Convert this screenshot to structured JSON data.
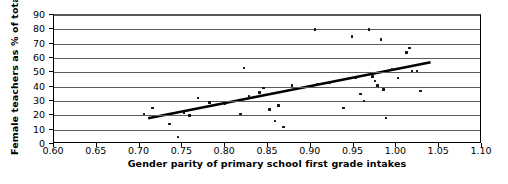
{
  "chart_data": {
    "type": "scatter",
    "title": "",
    "xlabel": "Gender parity of primary school first grade intakes",
    "ylabel": "Female teachers as % of total",
    "xlim": [
      0.6,
      1.1
    ],
    "ylim": [
      0,
      90
    ],
    "grid": true,
    "legend": "none",
    "xticks": [
      "0.60",
      "0.65",
      "0.70",
      "0.75",
      "0.80",
      "0.85",
      "0.90",
      "0.95",
      "1.00",
      "1.05",
      "1.10"
    ],
    "xtick_values": [
      0.6,
      0.65,
      0.7,
      0.75,
      0.8,
      0.85,
      0.9,
      0.95,
      1.0,
      1.05,
      1.1
    ],
    "yticks": [
      "0",
      "10",
      "20",
      "30",
      "40",
      "50",
      "60",
      "70",
      "80",
      "90"
    ],
    "ytick_values": [
      0,
      10,
      20,
      30,
      40,
      50,
      60,
      70,
      80,
      90
    ],
    "points": [
      {
        "x": 0.705,
        "y": 21
      },
      {
        "x": 0.715,
        "y": 25
      },
      {
        "x": 0.735,
        "y": 14
      },
      {
        "x": 0.745,
        "y": 5
      },
      {
        "x": 0.752,
        "y": 22
      },
      {
        "x": 0.758,
        "y": 20
      },
      {
        "x": 0.768,
        "y": 32
      },
      {
        "x": 0.782,
        "y": 29
      },
      {
        "x": 0.8,
        "y": 28
      },
      {
        "x": 0.818,
        "y": 21
      },
      {
        "x": 0.822,
        "y": 53
      },
      {
        "x": 0.828,
        "y": 33
      },
      {
        "x": 0.84,
        "y": 36
      },
      {
        "x": 0.845,
        "y": 39
      },
      {
        "x": 0.852,
        "y": 24
      },
      {
        "x": 0.858,
        "y": 16
      },
      {
        "x": 0.862,
        "y": 27
      },
      {
        "x": 0.868,
        "y": 12
      },
      {
        "x": 0.878,
        "y": 41
      },
      {
        "x": 0.905,
        "y": 80
      },
      {
        "x": 0.908,
        "y": 42
      },
      {
        "x": 0.922,
        "y": 43
      },
      {
        "x": 0.938,
        "y": 25
      },
      {
        "x": 0.948,
        "y": 75
      },
      {
        "x": 0.952,
        "y": 46
      },
      {
        "x": 0.958,
        "y": 35
      },
      {
        "x": 0.962,
        "y": 30
      },
      {
        "x": 0.968,
        "y": 80
      },
      {
        "x": 0.972,
        "y": 47
      },
      {
        "x": 0.975,
        "y": 44
      },
      {
        "x": 0.978,
        "y": 41
      },
      {
        "x": 0.982,
        "y": 73
      },
      {
        "x": 0.985,
        "y": 38
      },
      {
        "x": 0.988,
        "y": 18
      },
      {
        "x": 0.995,
        "y": 52
      },
      {
        "x": 1.002,
        "y": 46
      },
      {
        "x": 1.012,
        "y": 64
      },
      {
        "x": 1.015,
        "y": 67
      },
      {
        "x": 1.018,
        "y": 51
      },
      {
        "x": 1.024,
        "y": 51
      },
      {
        "x": 1.028,
        "y": 37
      }
    ],
    "trendline": {
      "x0": 0.71,
      "y0": 18,
      "x1": 1.04,
      "y1": 57
    }
  }
}
